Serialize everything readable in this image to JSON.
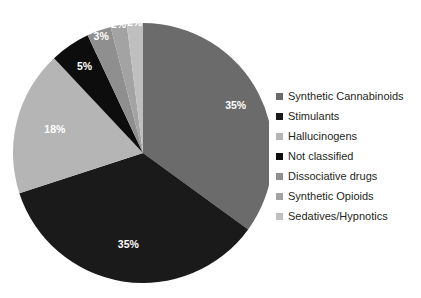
{
  "chart_data": {
    "type": "pie",
    "title": "",
    "subtitle": "",
    "xlabel": "",
    "ylabel": "",
    "grid": false,
    "legend_position": "right",
    "start_angle_deg": 0,
    "direction": "clockwise",
    "categories": [
      "Synthetic Cannabinoids",
      "Stimulants",
      "Hallucinogens",
      "Not classified",
      "Dissociative drugs",
      "Synthetic Opioids",
      "Sedatives/Hypnotics"
    ],
    "values": [
      35,
      35,
      18,
      5,
      3,
      2,
      2
    ],
    "data_labels": [
      "35%",
      "35%",
      "18%",
      "5%",
      "3%",
      "2%",
      "2%"
    ],
    "colors": [
      "#6b6b6b",
      "#1a1a1a",
      "#b5b5b5",
      "#0d0d0d",
      "#8f8f8f",
      "#a3a3a3",
      "#bfbfbf"
    ],
    "slices": [
      {
        "label": "Synthetic Cannabinoids",
        "value": 35,
        "data_label": "35%",
        "color": "#6b6b6b"
      },
      {
        "label": "Stimulants",
        "value": 35,
        "data_label": "35%",
        "color": "#1a1a1a"
      },
      {
        "label": "Hallucinogens",
        "value": 18,
        "data_label": "18%",
        "color": "#b5b5b5"
      },
      {
        "label": "Not classified",
        "value": 5,
        "data_label": "5%",
        "color": "#0d0d0d"
      },
      {
        "label": "Dissociative drugs",
        "value": 3,
        "data_label": "3%",
        "color": "#8f8f8f"
      },
      {
        "label": "Synthetic Opioids",
        "value": 2,
        "data_label": "2%",
        "color": "#a3a3a3"
      },
      {
        "label": "Sedatives/Hypnotics",
        "value": 2,
        "data_label": "2%",
        "color": "#bfbfbf"
      }
    ]
  },
  "legend": {
    "items": [
      {
        "label": "Synthetic Cannabinoids",
        "color": "#6b6b6b"
      },
      {
        "label": "Stimulants",
        "color": "#1a1a1a"
      },
      {
        "label": "Hallucinogens",
        "color": "#b5b5b5"
      },
      {
        "label": "Not classified",
        "color": "#0d0d0d"
      },
      {
        "label": "Dissociative drugs",
        "color": "#8f8f8f"
      },
      {
        "label": "Synthetic Opioids",
        "color": "#a3a3a3"
      },
      {
        "label": "Sedatives/Hypnotics",
        "color": "#bfbfbf"
      }
    ]
  },
  "canvas": {
    "background": "#ffffff",
    "label_text_color": "#ffffff",
    "legend_text_color": "#231f20"
  }
}
